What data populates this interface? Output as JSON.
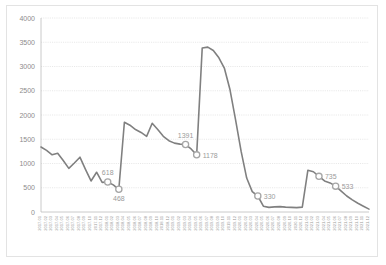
{
  "chart_data": {
    "type": "line",
    "title": "",
    "xlabel": "",
    "ylabel": "",
    "ylim": [
      0,
      4000
    ],
    "ytick_values": [
      0,
      500,
      1000,
      1500,
      2000,
      2500,
      3000,
      3500,
      4000
    ],
    "grid": true,
    "legend": "none",
    "series_name": "value",
    "line_color": "#808080",
    "marker_fill": "#ffffff",
    "marker_stroke": "#a6a6a6",
    "categories": [
      "2017.01",
      "2017.02",
      "2017.03",
      "2017.04",
      "2017.05",
      "2017.06",
      "2017.07",
      "2017.08",
      "2017.09",
      "2017.10",
      "2017.11",
      "2017.12",
      "2018.01",
      "2018.02",
      "2018.03",
      "2018.04",
      "2018.05",
      "2018.06",
      "2018.07",
      "2018.08",
      "2018.09",
      "2018.10",
      "2018.11",
      "2018.12",
      "2019.01",
      "2019.02",
      "2019.03",
      "2019.04",
      "2019.05",
      "2019.06",
      "2019.07",
      "2019.08",
      "2019.09",
      "2019.10",
      "2019.11",
      "2019.12",
      "2020.01",
      "2020.02",
      "2020.03",
      "2020.04",
      "2020.05",
      "2020.06",
      "2020.07",
      "2020.08",
      "2020.09",
      "2020.10",
      "2020.11",
      "2020.12",
      "2021.01",
      "2021.02",
      "2021.03",
      "2021.04",
      "2021.05",
      "2021.06",
      "2021.07",
      "2021.08",
      "2021.09",
      "2021.10",
      "2021.11",
      "2021.12"
    ],
    "values": [
      1340,
      1270,
      1180,
      1210,
      1060,
      900,
      1010,
      1130,
      880,
      640,
      820,
      610,
      618,
      560,
      468,
      1850,
      1790,
      1700,
      1640,
      1560,
      1830,
      1700,
      1560,
      1470,
      1420,
      1400,
      1391,
      1300,
      1178,
      3380,
      3400,
      3330,
      3180,
      2960,
      2520,
      1900,
      1250,
      700,
      420,
      330,
      120,
      95,
      105,
      110,
      100,
      95,
      90,
      100,
      860,
      830,
      735,
      640,
      600,
      533,
      430,
      330,
      250,
      180,
      120,
      60
    ],
    "labeled_points": [
      {
        "index": 12,
        "label": "618",
        "position": "above"
      },
      {
        "index": 14,
        "label": "468",
        "position": "below"
      },
      {
        "index": 26,
        "label": "1391",
        "position": "above"
      },
      {
        "index": 28,
        "label": "1178",
        "position": "right"
      },
      {
        "index": 39,
        "label": "330",
        "position": "right"
      },
      {
        "index": 50,
        "label": "735",
        "position": "right"
      },
      {
        "index": 53,
        "label": "533",
        "position": "right"
      }
    ]
  }
}
